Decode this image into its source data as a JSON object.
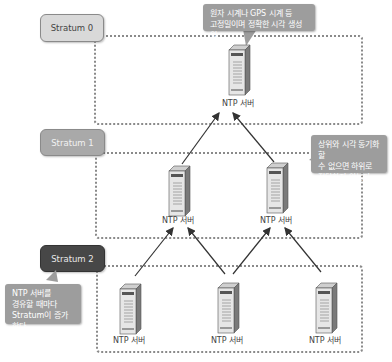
{
  "strata": [
    {
      "label": "Stratum 0",
      "color": "#d9d9d9"
    },
    {
      "label": "Stratum 1",
      "color": "#a9a9a9"
    },
    {
      "label": "Stratum 2",
      "color": "#474747"
    }
  ],
  "callouts": {
    "stratum0": "원자 시계나 GPS 시계 등\n고정밀이며 정확한 시각 생성원",
    "stratum1": "상위와 시각 동기화할\n수 없으면 하위로\n전달하지 않는다",
    "stratum2": "NTP 서버를\n경유할 때마다\nStratum이 증가한다"
  },
  "servers": {
    "s0": {
      "label": "NTP 서버"
    },
    "s1_left": {
      "label": "NTP 서버"
    },
    "s1_right": {
      "label": "NTP 서버"
    },
    "s2_left": {
      "label": "NTP 서버"
    },
    "s2_mid": {
      "label": "NTP 서버"
    },
    "s2_right": {
      "label": "NTP 서버"
    }
  },
  "colors": {
    "callout": "#9d9d9d",
    "dotted_border": "#8a8a8a",
    "arrow": "#333333"
  }
}
